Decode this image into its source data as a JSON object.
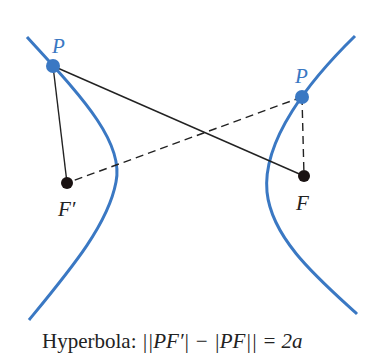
{
  "diagram": {
    "colors": {
      "curve": "#3a78c3",
      "point_p": "#3a78c3",
      "focus": "#1a1212",
      "solid_line": "#222222",
      "dashed_line": "#222222",
      "text": "#222222",
      "label_p": "#3a78c3"
    },
    "branches": [
      {
        "name": "left-branch",
        "path": "M 27 37 Q 130 150 116 182 Q 100 240 29 320"
      },
      {
        "name": "right-branch",
        "path": "M 355 36 Q 290 100 270 170 Q 262 220 357 314"
      }
    ],
    "points": {
      "P_left": {
        "label": "P",
        "x": 53,
        "y": 66
      },
      "P_right": {
        "label": "P",
        "x": 302,
        "y": 97
      },
      "F_prime": {
        "label": "F′",
        "x": 67,
        "y": 183
      },
      "F": {
        "label": "F",
        "x": 304,
        "y": 176
      }
    },
    "segments": [
      {
        "from": "P_left",
        "to": "F_prime",
        "style": "solid"
      },
      {
        "from": "P_left",
        "to": "F",
        "style": "solid"
      },
      {
        "from": "P_right",
        "to": "F_prime",
        "style": "dashed"
      },
      {
        "from": "P_right",
        "to": "F",
        "style": "dashed"
      }
    ],
    "labels": {
      "p_left": "P",
      "p_right": "P",
      "f_prime": "F′",
      "f": "F"
    },
    "caption": {
      "prefix": "Hyperbola: ",
      "formula": "||PF′| − |PF|| = 2a"
    }
  }
}
